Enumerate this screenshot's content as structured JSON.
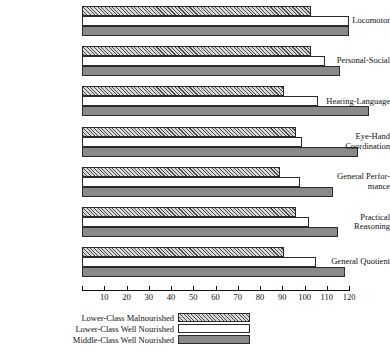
{
  "chart_data": {
    "type": "bar",
    "orientation": "horizontal",
    "title": "",
    "xlabel": "",
    "ylabel": "",
    "xlim": [
      0,
      120
    ],
    "grid": false,
    "legend_position": "bottom",
    "tick_labels": [
      "10",
      "20",
      "30",
      "40",
      "50",
      "60",
      "70",
      "80",
      "90",
      "100",
      "110",
      "120"
    ],
    "ticks": [
      10,
      20,
      30,
      40,
      50,
      60,
      70,
      80,
      90,
      100,
      110,
      120
    ],
    "categories": [
      "Locomotor",
      "Personal-Social",
      "Hearing-Language",
      "Eye-Hand Coordination",
      "General Perfor- mance",
      "Practical Reasoning",
      "General Quotient"
    ],
    "category_lines": [
      [
        "Locomotor"
      ],
      [
        "Personal-Social"
      ],
      [
        "Hearing-Language"
      ],
      [
        "Eye-Hand",
        "Coordination"
      ],
      [
        "General Perfor-",
        "mance"
      ],
      [
        "Practical",
        "Reasoning"
      ],
      [
        "General Quotient"
      ]
    ],
    "series": [
      {
        "name": "Lower-Class Malnourished",
        "fill": "hatch",
        "color": "#d9d9d9",
        "values": [
          103,
          103,
          91,
          96,
          89,
          96,
          91
        ]
      },
      {
        "name": "Lower-Class Well Nourished",
        "fill": "solid",
        "color": "#ffffff",
        "values": [
          120,
          109,
          106,
          99,
          98,
          102,
          105
        ]
      },
      {
        "name": "Middle-Class Well Nourished",
        "fill": "solid",
        "color": "#8a8a8a",
        "values": [
          120,
          116,
          129,
          124,
          113,
          115,
          118
        ]
      }
    ]
  },
  "legend": {
    "items": [
      {
        "label": "Lower-Class Malnourished",
        "swatch": "hatch"
      },
      {
        "label": "Lower-Class Well Nourished",
        "swatch": "white"
      },
      {
        "label": "Middle-Class Well Nourished",
        "swatch": "dark"
      }
    ]
  }
}
